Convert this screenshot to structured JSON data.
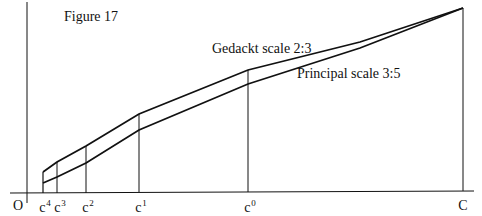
{
  "figure": {
    "title": "Figure 17",
    "origin_label": "O",
    "curves": [
      {
        "name": "Gedackt scale 2:3",
        "label": "Gedackt scale 2:3"
      },
      {
        "name": "Principal scale 3:5",
        "label": "Principal scale 3:5"
      }
    ],
    "ticks": [
      {
        "base": "c",
        "sup": "4"
      },
      {
        "base": "c",
        "sup": "3"
      },
      {
        "base": "c",
        "sup": "2"
      },
      {
        "base": "c",
        "sup": "1"
      },
      {
        "base": "c",
        "sup": "0"
      },
      {
        "base": "C",
        "sup": ""
      }
    ]
  },
  "colors": {
    "line": "#111111",
    "background": "#ffffff"
  }
}
